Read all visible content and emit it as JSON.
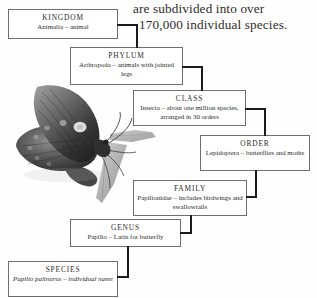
{
  "heading": {
    "line1": "are subdivided into over",
    "line2": "170,000 individual species."
  },
  "colors": {
    "background": "#fefefe",
    "text": "#2b2b2b",
    "box_border": "#6e6e6e",
    "connector": "#1a1a1a"
  },
  "illustration": {
    "name": "butterfly-specimen",
    "subject": "Papilio palinurus butterfly perched on a leaf",
    "style": "grayscale photograph"
  },
  "taxonomy": {
    "levels": [
      {
        "rank": "KINGDOM",
        "description": "Animalia – animal",
        "italic": false
      },
      {
        "rank": "PHYLUM",
        "description": "Arthropoda – animals with jointed legs",
        "italic": false
      },
      {
        "rank": "CLASS",
        "description": "Insecta – about one million species, arranged in 30 orders",
        "italic": false
      },
      {
        "rank": "ORDER",
        "description": "Lepidoptera – butterflies and moths",
        "italic": false
      },
      {
        "rank": "FAMILY",
        "description": "Papilionidae – includes birdwings and swallowtails",
        "italic": false
      },
      {
        "rank": "GENUS",
        "description": "Papilio – Latin for butterfly",
        "italic": false
      },
      {
        "rank": "SPECIES",
        "description": "Papilio palinurus – individual name",
        "italic": true
      }
    ]
  }
}
